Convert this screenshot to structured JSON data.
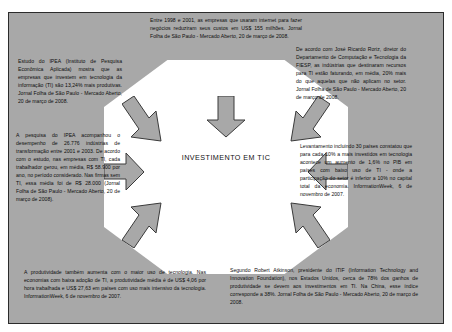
{
  "diagram": {
    "center": {
      "label": "INVESTIMENTO EM TIC"
    },
    "colors": {
      "plate": "#a8a8a8",
      "hub": "#ffffff",
      "border": "#2b2b2b",
      "text": "#0d0d0d"
    },
    "boxes": [
      {
        "id": "top",
        "position": "top-center",
        "text": "Entre 1998 e 2001, as empresas que usaram internet para fazer negócios reduziram seus custos em US$ 155 milhões. Jornal Folha de São Paulo - Mercado Aberto, 20 de março de 2008."
      },
      {
        "id": "left-top",
        "position": "upper-left",
        "text": "Estudo do IPEA (Instituto de Pesquisa Econômica Aplicada) mostra que as empresas que investem em tecnologia da informação (TI) são 13,24% mais produtivas. Jornal Folha de São Paulo - Mercado Aberto, 20 de março de 2008."
      },
      {
        "id": "right-top",
        "position": "upper-right",
        "text": "De acordo com José Ricardo Roriz, diretor do Departamento de Computação e Tecnologia da FIESP, as indústrias que destinaram recursos para TI estão faturando, em média, 20% mais do que aquelas que não aplicam no setor. Jornal Folha de São Paulo - Mercado Aberto, 20 de março de 2008."
      },
      {
        "id": "left-mid",
        "position": "middle-left",
        "text": "A pesquisa do IPEA acompanhou o desempenho de 26.776 indústrias de transformação entre 2001 e 2003. De acordo com o estudo, nas empresas com TI, cada trabalhador gerou, em média, R$ 58.900 por ano, no período considerado. Nas firmas sem TI, essa média foi de R$ 28.000 (Jornal Folha de São Paulo - Mercado Aberto, 20 de março de 2008)."
      },
      {
        "id": "right-mid",
        "position": "middle-right",
        "text": "Levantamento incluindo 30 países constatou que para cada 10% a mais investidos em tecnologia acontece um aumento de 1,6% no PIB em países com baixo uso de TI - onde a participação do setor é inferior a 10% no capital total da economia. InformationWeek, 6 de novembro de 2007."
      },
      {
        "id": "bottom-left",
        "position": "bottom-left",
        "text": "A produtividade também aumenta com o maior uso de tecnologia. Nas economias com baixa adoção de TI, a produtividade média é de US$ 4,06 por hora trabalhada e US$ 27,63 em países com uso mais intensivo da tecnologia. InformationWeek, 6 de novembro de 2007."
      },
      {
        "id": "bottom-right",
        "position": "bottom-right",
        "text": "Segundo Robert Atkinson, presidente do ITIF (Information Technology and Innovation Foundation), nos Estados Unidos, cerca de 78% dos ganhos de produtividade se devem aos investimentos em TI. Na China, esse índice corresponde a 38%. Jornal Folha de São Paulo - Mercado Aberto, 20 de março de 2008."
      }
    ],
    "arrows": [
      {
        "id": "arrow-top",
        "direction": "down"
      },
      {
        "id": "arrow-upper-left",
        "direction": "down-right"
      },
      {
        "id": "arrow-upper-right",
        "direction": "down-left"
      },
      {
        "id": "arrow-middle-left",
        "direction": "right"
      },
      {
        "id": "arrow-middle-right",
        "direction": "left"
      },
      {
        "id": "arrow-lower-left",
        "direction": "up-right"
      },
      {
        "id": "arrow-lower-right",
        "direction": "up-left"
      }
    ]
  }
}
